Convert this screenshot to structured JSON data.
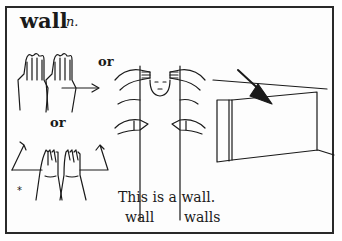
{
  "entry": {
    "headword": "wall",
    "part_of_speech": "n.",
    "alternatives": [
      "or",
      "or"
    ],
    "variant_marker": "*",
    "example_sentence": "This is a wall.",
    "forms": [
      "wall",
      "walls"
    ]
  },
  "illustrations": [
    {
      "name": "flat-hands-moving-right",
      "description": "two flat hands side by side with arrow to the right"
    },
    {
      "name": "hands-at-face-sign",
      "description": "hands near face moving down vertical lines"
    },
    {
      "name": "hands-spreading-up",
      "description": "two hands together with arrows up and out"
    },
    {
      "name": "wall-picture",
      "description": "wall drawing with arrow pointing at it"
    }
  ],
  "colors": {
    "ink": "#1a1a1a",
    "border": "#2a2a2a",
    "background": "#fdfdfd"
  }
}
